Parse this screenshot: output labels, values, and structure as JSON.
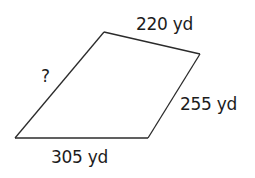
{
  "figure": {
    "shape": "quadrilateral",
    "vertices": {
      "top_left": [
        104,
        32
      ],
      "top_right": [
        200,
        54
      ],
      "bottom_right": [
        148,
        138
      ],
      "bottom_left": [
        15,
        138
      ]
    },
    "sides": {
      "top": {
        "label": "220 yd",
        "value": 220,
        "unit": "yd"
      },
      "right": {
        "label": "255 yd",
        "value": 255,
        "unit": "yd"
      },
      "bottom": {
        "label": "305 yd",
        "value": 305,
        "unit": "yd"
      },
      "left": {
        "label": "?",
        "value": null,
        "unit": "yd"
      }
    },
    "stroke_color": "#2b2b2b",
    "text_color": "#1c1c1c"
  }
}
